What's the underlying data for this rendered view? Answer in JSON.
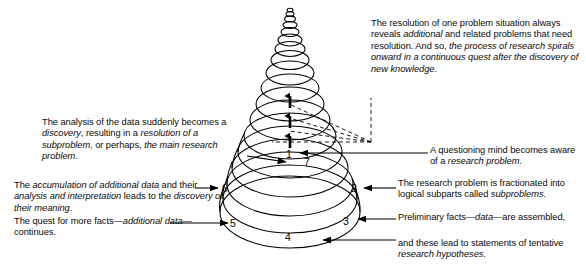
{
  "figure": {
    "ink_color": "#000000",
    "background_color": "#ffffff"
  },
  "stage_numbers": [
    {
      "id": "1",
      "label": "1",
      "x": 290,
      "y": 155
    },
    {
      "id": "7",
      "label": "7",
      "x": 307,
      "y": 162
    },
    {
      "id": "6",
      "label": "6",
      "x": 225,
      "y": 188
    },
    {
      "id": "2",
      "label": "2",
      "x": 353,
      "y": 188
    },
    {
      "id": "5",
      "label": "5",
      "x": 233,
      "y": 224
    },
    {
      "id": "3",
      "label": "3",
      "x": 345,
      "y": 222
    },
    {
      "id": "4",
      "label": "4",
      "x": 288,
      "y": 237
    }
  ],
  "captions": {
    "discovery": "The analysis of the data suddenly becomes a discovery, resulting in a resolution of a subproblem, or perhaps, the main research problem.",
    "discovery_parts": [
      {
        "t": "The analysis of the data suddenly becomes a ",
        "i": false
      },
      {
        "t": "discovery",
        "i": true
      },
      {
        "t": ", resulting in a ",
        "i": false
      },
      {
        "t": "resolution of a subproblem",
        "i": true
      },
      {
        "t": ", or perhaps, ",
        "i": false
      },
      {
        "t": "the main research problem",
        "i": true
      },
      {
        "t": ".",
        "i": false
      }
    ],
    "accumulation": "The accumulation of additional data and their analysis and interpretation leads to the discovery of their meaning.",
    "accumulation_parts": [
      {
        "t": "The ",
        "i": false
      },
      {
        "t": "accumulation of additional data",
        "i": true
      },
      {
        "t": " and their ",
        "i": false
      },
      {
        "t": "analysis and interpretation",
        "i": true
      },
      {
        "t": " leads to the ",
        "i": false
      },
      {
        "t": "discovery of their meaning",
        "i": true
      },
      {
        "t": ".",
        "i": false
      }
    ],
    "quest": "The quest for more facts—additional data—continues.",
    "quest_parts": [
      {
        "t": "The quest for more facts—",
        "i": false
      },
      {
        "t": "additional data",
        "i": true
      },
      {
        "t": "—continues.",
        "i": false
      }
    ],
    "resolution": "The resolution of one problem situation always reveals additional and related problems that need resolution. And so, the process of research spirals onward in a continuous quest after the discovery of new knowledge.",
    "resolution_parts": [
      {
        "t": "The resolution of one problem situation always reveals ",
        "i": false
      },
      {
        "t": "additional",
        "i": true
      },
      {
        "t": " and related problems that need resolution. And so, ",
        "i": false
      },
      {
        "t": "the process of research spirals onward in a continuous quest after the discovery of new knowledge",
        "i": true
      },
      {
        "t": ".",
        "i": false
      }
    ],
    "questioning": "A questioning mind becomes aware of a research problem.",
    "questioning_parts": [
      {
        "t": "A questioning mind becomes aware of a ",
        "i": false
      },
      {
        "t": "research problem",
        "i": true
      },
      {
        "t": ".",
        "i": false
      }
    ],
    "fractionated": "The research problem is fractionated into logical subparts called subproblems.",
    "fractionated_parts": [
      {
        "t": "The research problem is fractionated into logical subparts called ",
        "i": false
      },
      {
        "t": "subproblems",
        "i": true
      },
      {
        "t": ".",
        "i": false
      }
    ],
    "preliminary": "Preliminary facts—data—are assembled,",
    "preliminary_parts": [
      {
        "t": "Preliminary facts—",
        "i": false
      },
      {
        "t": "data",
        "i": true
      },
      {
        "t": "—are assembled,",
        "i": false
      }
    ],
    "statements": "and these lead to statements of tentative research hypotheses.",
    "statements_parts": [
      {
        "t": "and these lead to statements of tentative ",
        "i": false
      },
      {
        "t": "research hypotheses",
        "i": true
      },
      {
        "t": ".",
        "i": false
      }
    ]
  },
  "spiral": {
    "type": "conical-helix",
    "turns": 13,
    "axis_x": 290,
    "top_y": 8,
    "bottom_y": 248,
    "max_radius_x": 70,
    "min_radius_x": 5,
    "ellipse_ratio": 0.32,
    "upward_arrows": 3,
    "dashed_fan_lines": 4,
    "dashed_vertex": {
      "x": 371,
      "y": 142
    }
  }
}
